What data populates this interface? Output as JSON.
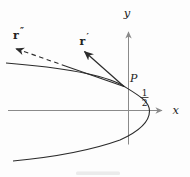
{
  "figure": {
    "axis_labels": {
      "x": "x",
      "y": "y"
    },
    "point_label": "P",
    "vectors": {
      "r_prime": {
        "base": "r",
        "mark": "′"
      },
      "r_double_prime": {
        "base": "r",
        "mark": "″"
      }
    },
    "intercept_fraction": {
      "numerator": "1",
      "denominator": "2"
    },
    "colors": {
      "ink": "#2b2b2b",
      "axis": "#8a8a8a",
      "background": "#fdfdfd",
      "label": "#222222"
    }
  }
}
